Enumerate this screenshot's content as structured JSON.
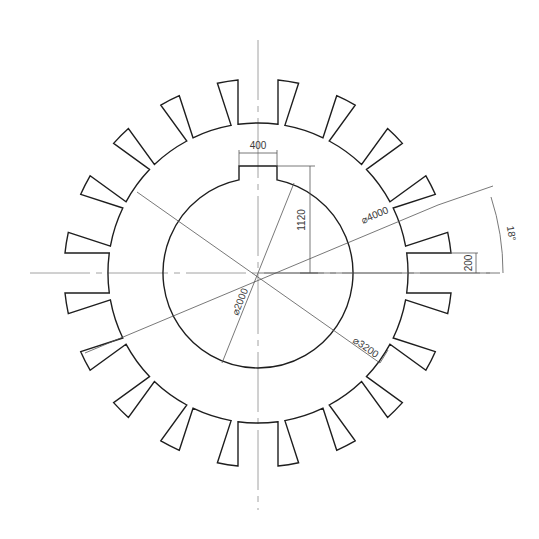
{
  "drawing": {
    "title": "Gear plate with keyed bore",
    "center": {
      "x": 258,
      "y": 273
    },
    "scale_px_per_unit": 0.0485,
    "tooth_count": 20,
    "tooth_pitch_deg": 18,
    "tip_radius_px": 194,
    "root_radius_px": 150,
    "slot_halfwidth_px": 20,
    "bore_radius_px": 95,
    "keyway": {
      "halfwidth_px": 19,
      "top_y": 166
    }
  },
  "dimensions": {
    "keyway_width": "400",
    "keyway_height": "1120",
    "outer_diameter": "⌀4000",
    "bore_diameter": "⌀2000",
    "root_diameter": "⌀3200",
    "slot_half_width": "200",
    "tooth_angle": "18°"
  },
  "colors": {
    "outline": "#1e1e1e",
    "centerline": "#8a8a8a",
    "dimension": "#555555"
  }
}
